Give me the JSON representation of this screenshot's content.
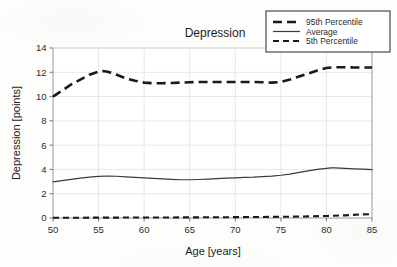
{
  "chart_data": {
    "type": "line",
    "title": "Depression",
    "xlabel": "Age [years]",
    "ylabel": "Depression [points]",
    "xlim": [
      50,
      85
    ],
    "ylim": [
      0,
      14
    ],
    "xticks": [
      50,
      55,
      60,
      65,
      70,
      75,
      80,
      85
    ],
    "yticks": [
      0,
      2,
      4,
      6,
      8,
      10,
      12,
      14
    ],
    "grid": true,
    "legend_position": "top-right",
    "series": [
      {
        "name": "95th Percentile",
        "style": "dashed-thick",
        "color": "#1a1a1a",
        "x": [
          50,
          51,
          52,
          53,
          54,
          55,
          55.5,
          56,
          57,
          58,
          59,
          60,
          61,
          62,
          63,
          64,
          65,
          66,
          67,
          68,
          69,
          70,
          71,
          72,
          73,
          74,
          75,
          76,
          77,
          78,
          79,
          80,
          81,
          82,
          83,
          84,
          85
        ],
        "values": [
          10.0,
          10.5,
          11.0,
          11.4,
          11.8,
          12.05,
          12.1,
          12.05,
          11.8,
          11.5,
          11.3,
          11.15,
          11.1,
          11.1,
          11.12,
          11.15,
          11.18,
          11.2,
          11.2,
          11.2,
          11.2,
          11.2,
          11.2,
          11.2,
          11.18,
          11.15,
          11.2,
          11.4,
          11.65,
          11.9,
          12.15,
          12.35,
          12.42,
          12.42,
          12.4,
          12.4,
          12.4
        ]
      },
      {
        "name": "Average",
        "style": "solid-thin",
        "color": "#3a3a3a",
        "x": [
          50,
          51,
          52,
          53,
          54,
          55,
          56,
          57,
          58,
          59,
          60,
          61,
          62,
          63,
          64,
          65,
          66,
          67,
          68,
          69,
          70,
          71,
          72,
          73,
          74,
          75,
          76,
          77,
          78,
          79,
          80,
          80.5,
          81,
          82,
          83,
          84,
          85
        ],
        "values": [
          2.98,
          3.08,
          3.18,
          3.28,
          3.37,
          3.43,
          3.46,
          3.44,
          3.39,
          3.34,
          3.3,
          3.26,
          3.22,
          3.18,
          3.15,
          3.15,
          3.17,
          3.2,
          3.24,
          3.28,
          3.31,
          3.34,
          3.36,
          3.4,
          3.45,
          3.52,
          3.62,
          3.75,
          3.88,
          4.0,
          4.08,
          4.12,
          4.12,
          4.08,
          4.05,
          4.02,
          3.98
        ]
      },
      {
        "name": "5th Percentile",
        "style": "dashed-fine",
        "color": "#1a1a1a",
        "x": [
          50,
          55,
          60,
          65,
          70,
          75,
          78,
          80,
          82,
          83,
          84,
          85
        ],
        "values": [
          0.02,
          0.03,
          0.04,
          0.05,
          0.07,
          0.1,
          0.13,
          0.17,
          0.22,
          0.26,
          0.3,
          0.32
        ]
      }
    ]
  },
  "legend": {
    "items": [
      {
        "label": "95th Percentile"
      },
      {
        "label": "Average"
      },
      {
        "label": "5th Percentile"
      }
    ]
  }
}
